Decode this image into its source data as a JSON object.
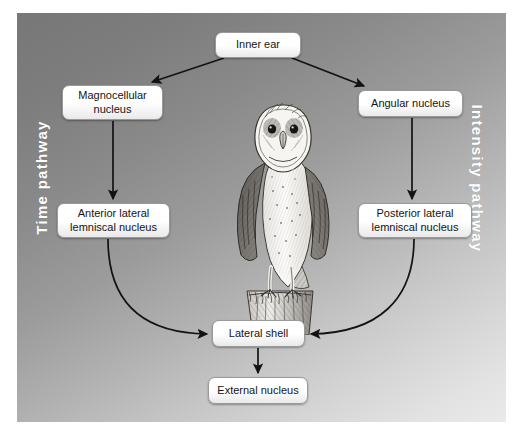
{
  "figure": {
    "background_from": "#777777",
    "background_to": "#eaeaea"
  },
  "side_labels": {
    "left": "Time pathway",
    "right": "Intensity pathway"
  },
  "nodes": [
    {
      "id": "inner-ear",
      "label": "Inner ear"
    },
    {
      "id": "magnocellular",
      "label": "Magnocellular nucleus"
    },
    {
      "id": "angular",
      "label": "Angular nucleus"
    },
    {
      "id": "anterior",
      "label": "Anterior lateral lemniscal nucleus"
    },
    {
      "id": "posterior",
      "label": "Posterior lateral lemniscal nucleus"
    },
    {
      "id": "lateral-shell",
      "label": "Lateral shell"
    },
    {
      "id": "external-nucleus",
      "label": "External nucleus"
    }
  ],
  "illustration": {
    "name": "barn-owl-on-post",
    "description": "Pen-and-ink drawing of a barn owl perched on a wooden post"
  },
  "connections": [
    {
      "from": "inner-ear",
      "to": "magnocellular",
      "style": "straight-arrow"
    },
    {
      "from": "inner-ear",
      "to": "angular",
      "style": "straight-arrow"
    },
    {
      "from": "magnocellular",
      "to": "anterior",
      "style": "straight-arrow"
    },
    {
      "from": "angular",
      "to": "posterior",
      "style": "straight-arrow"
    },
    {
      "from": "anterior",
      "to": "lateral-shell",
      "style": "curved-arrow"
    },
    {
      "from": "posterior",
      "to": "lateral-shell",
      "style": "curved-arrow"
    },
    {
      "from": "lateral-shell",
      "to": "external-nucleus",
      "style": "straight-arrow"
    }
  ]
}
